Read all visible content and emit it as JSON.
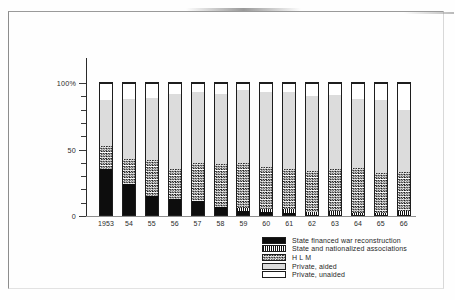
{
  "chart_data": {
    "type": "bar",
    "subtype": "stacked-percentage",
    "title": "",
    "xlabel": "",
    "ylabel": "",
    "ylim": [
      0,
      100
    ],
    "grid": false,
    "legend_position": "bottom-right",
    "y_axis": {
      "labels": [
        "100%",
        "50",
        "0"
      ],
      "label_values": [
        100,
        50,
        0
      ],
      "minor_tick_step": 10
    },
    "categories": [
      "1953",
      "54",
      "55",
      "56",
      "57",
      "58",
      "59",
      "60",
      "61",
      "62",
      "63",
      "64",
      "65",
      "66"
    ],
    "series": [
      {
        "name": "State financed war reconstruction",
        "pattern": "solid-black",
        "color": "#0d0d0d",
        "values": [
          35,
          24,
          15,
          13,
          11,
          7,
          4,
          3,
          2,
          1,
          1,
          0.5,
          0.5,
          0.5
        ]
      },
      {
        "name": "State and nationalized associations",
        "pattern": "vertical-stripes",
        "color": "#101010",
        "values": [
          0,
          0,
          0,
          0,
          0,
          0,
          2,
          2,
          3,
          2,
          2.5,
          2,
          1.5,
          3
        ]
      },
      {
        "name": "H L M",
        "pattern": "checkered",
        "color": "#1a1a1a",
        "values": [
          18,
          19,
          27,
          22,
          29,
          32,
          34,
          32,
          30,
          31,
          31.5,
          33.5,
          30,
          29.5
        ]
      },
      {
        "name": "Private, aided",
        "pattern": "light-gray",
        "color": "#dcdcdc",
        "values": [
          34,
          45,
          47,
          57,
          53,
          53,
          55,
          56,
          58,
          56,
          56,
          52,
          55,
          47
        ]
      },
      {
        "name": "Private, unaided",
        "pattern": "white",
        "color": "#ffffff",
        "values": [
          13,
          12,
          11,
          8,
          7,
          8,
          5,
          7,
          7,
          10,
          9,
          12,
          13,
          20
        ]
      }
    ],
    "cumulative_tops": {
      "note": "running top of each stack segment, percent",
      "state_war": [
        35,
        24,
        15,
        13,
        11,
        7,
        4,
        3,
        2,
        1,
        1,
        0.5,
        0.5,
        0.5
      ],
      "state_assoc": [
        35,
        24,
        15,
        13,
        11,
        7,
        6,
        5,
        5,
        3,
        3.5,
        2.5,
        2,
        3.5
      ],
      "hlm": [
        53,
        43,
        42,
        35,
        40,
        39,
        40,
        37,
        35,
        34,
        35,
        36,
        32,
        33
      ],
      "private_aided": [
        87,
        88,
        89,
        92,
        93,
        92,
        95,
        93,
        93,
        90,
        91,
        88,
        87,
        80
      ],
      "private_unaided": [
        100,
        100,
        100,
        100,
        100,
        100,
        100,
        100,
        100,
        100,
        100,
        100,
        100,
        100
      ]
    }
  },
  "legend": {
    "items": [
      {
        "label": "State  financed  war  reconstruction",
        "swatch": "solid-black"
      },
      {
        "label": "State  and  nationalized  associations",
        "swatch": "vertical-stripes"
      },
      {
        "label": "H L M",
        "swatch": "checkered"
      },
      {
        "label": "Private,  aided",
        "swatch": "light-gray"
      },
      {
        "label": "Private,  unaided",
        "swatch": "white"
      }
    ]
  }
}
